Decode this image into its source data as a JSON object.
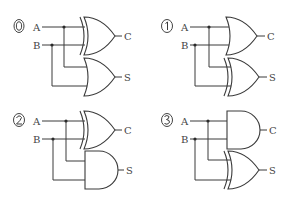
{
  "diagram": {
    "type": "logic-circuit-choices",
    "panels": [
      {
        "option": "0",
        "input_a": "A",
        "input_b": "B",
        "top_gate": "XOR",
        "top_output": "C",
        "bottom_gate": "OR",
        "bottom_output": "S"
      },
      {
        "option": "1",
        "input_a": "A",
        "input_b": "B",
        "top_gate": "OR",
        "top_output": "C",
        "bottom_gate": "XOR",
        "bottom_output": "S"
      },
      {
        "option": "2",
        "input_a": "A",
        "input_b": "B",
        "top_gate": "XOR",
        "top_output": "C",
        "bottom_gate": "AND",
        "bottom_output": "S"
      },
      {
        "option": "3",
        "input_a": "A",
        "input_b": "B",
        "top_gate": "AND",
        "top_output": "C",
        "bottom_gate": "XOR",
        "bottom_output": "S"
      }
    ],
    "colors": {
      "line": "#3a3a3a",
      "background": "#ffffff"
    }
  }
}
